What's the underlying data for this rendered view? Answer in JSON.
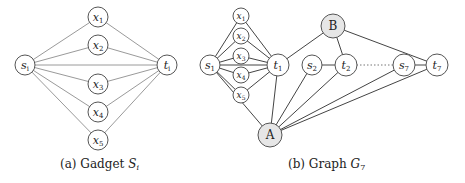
{
  "figure_a": {
    "caption_prefix": "(a) Gadget ",
    "caption_var": "S",
    "caption_sub": "i",
    "nodes": [
      {
        "id": "s_i",
        "base": "s",
        "sub": "i",
        "x": 25,
        "y": 65,
        "r": 10
      },
      {
        "id": "x1",
        "base": "x",
        "sub": "1",
        "x": 98,
        "y": 17,
        "r": 10
      },
      {
        "id": "x2",
        "base": "x",
        "sub": "2",
        "x": 98,
        "y": 45,
        "r": 10
      },
      {
        "id": "x3",
        "base": "x",
        "sub": "3",
        "x": 98,
        "y": 84,
        "r": 10
      },
      {
        "id": "x4",
        "base": "x",
        "sub": "4",
        "x": 98,
        "y": 112,
        "r": 10
      },
      {
        "id": "x5",
        "base": "x",
        "sub": "5",
        "x": 98,
        "y": 140,
        "r": 10
      },
      {
        "id": "t_i",
        "base": "t",
        "sub": "i",
        "x": 167,
        "y": 65,
        "r": 10
      }
    ],
    "edges": [
      [
        "s_i",
        "x1"
      ],
      [
        "s_i",
        "x2"
      ],
      [
        "s_i",
        "x3"
      ],
      [
        "s_i",
        "x4"
      ],
      [
        "s_i",
        "x5"
      ],
      [
        "s_i",
        "t_i"
      ],
      [
        "x1",
        "t_i"
      ],
      [
        "x2",
        "t_i"
      ],
      [
        "x3",
        "t_i"
      ],
      [
        "x4",
        "t_i"
      ],
      [
        "x5",
        "t_i"
      ]
    ]
  },
  "figure_b": {
    "caption_prefix": "(b) Graph ",
    "caption_var": "G",
    "caption_sub": "7",
    "nodes": [
      {
        "id": "s1",
        "base": "s",
        "sub": "1",
        "x": 210,
        "y": 65,
        "r": 10
      },
      {
        "id": "bx1",
        "base": "x",
        "sub": "1",
        "x": 241,
        "y": 16,
        "r": 8
      },
      {
        "id": "bx2",
        "base": "x",
        "sub": "2",
        "x": 241,
        "y": 36,
        "r": 8
      },
      {
        "id": "bx3",
        "base": "x",
        "sub": "3",
        "x": 241,
        "y": 56,
        "r": 8
      },
      {
        "id": "bx4",
        "base": "x",
        "sub": "4",
        "x": 241,
        "y": 75,
        "r": 8
      },
      {
        "id": "bx5",
        "base": "x",
        "sub": "5",
        "x": 241,
        "y": 95,
        "r": 8
      },
      {
        "id": "t1",
        "base": "t",
        "sub": "1",
        "x": 278,
        "y": 65,
        "r": 11
      },
      {
        "id": "B",
        "base": "B",
        "sub": "",
        "x": 333,
        "y": 26,
        "r": 12,
        "special": true
      },
      {
        "id": "s2",
        "base": "s",
        "sub": "2",
        "x": 312,
        "y": 65,
        "r": 10
      },
      {
        "id": "t2",
        "base": "t",
        "sub": "2",
        "x": 346,
        "y": 65,
        "r": 11
      },
      {
        "id": "s7",
        "base": "s",
        "sub": "7",
        "x": 404,
        "y": 65,
        "r": 11
      },
      {
        "id": "t7",
        "base": "t",
        "sub": "7",
        "x": 437,
        "y": 65,
        "r": 11
      },
      {
        "id": "A",
        "base": "A",
        "sub": "",
        "x": 270,
        "y": 135,
        "r": 12,
        "special": true
      }
    ],
    "edges": [
      [
        "s1",
        "bx1"
      ],
      [
        "s1",
        "bx2"
      ],
      [
        "s1",
        "bx3"
      ],
      [
        "s1",
        "bx4"
      ],
      [
        "s1",
        "bx5"
      ],
      [
        "s1",
        "t1"
      ],
      [
        "bx1",
        "t1"
      ],
      [
        "bx2",
        "t1"
      ],
      [
        "bx3",
        "t1"
      ],
      [
        "bx4",
        "t1"
      ],
      [
        "bx5",
        "t1"
      ],
      [
        "s1",
        "A"
      ],
      [
        "t1",
        "A"
      ],
      [
        "t1",
        "B"
      ],
      [
        "s2",
        "t2"
      ],
      [
        "B",
        "t2"
      ],
      [
        "B",
        "t7"
      ],
      [
        "s2",
        "A"
      ],
      [
        "t2",
        "A"
      ],
      [
        "s7",
        "A"
      ],
      [
        "t7",
        "A"
      ],
      [
        "s7",
        "t7"
      ]
    ],
    "dotted_edges": [
      [
        "t2",
        "s7"
      ]
    ]
  },
  "colors": {
    "edge_a": "#9a9a9a",
    "edge_b": "#444444",
    "node_fill": "#ffffff",
    "special_fill": "#e6e6e6",
    "node_stroke": "#555555"
  }
}
